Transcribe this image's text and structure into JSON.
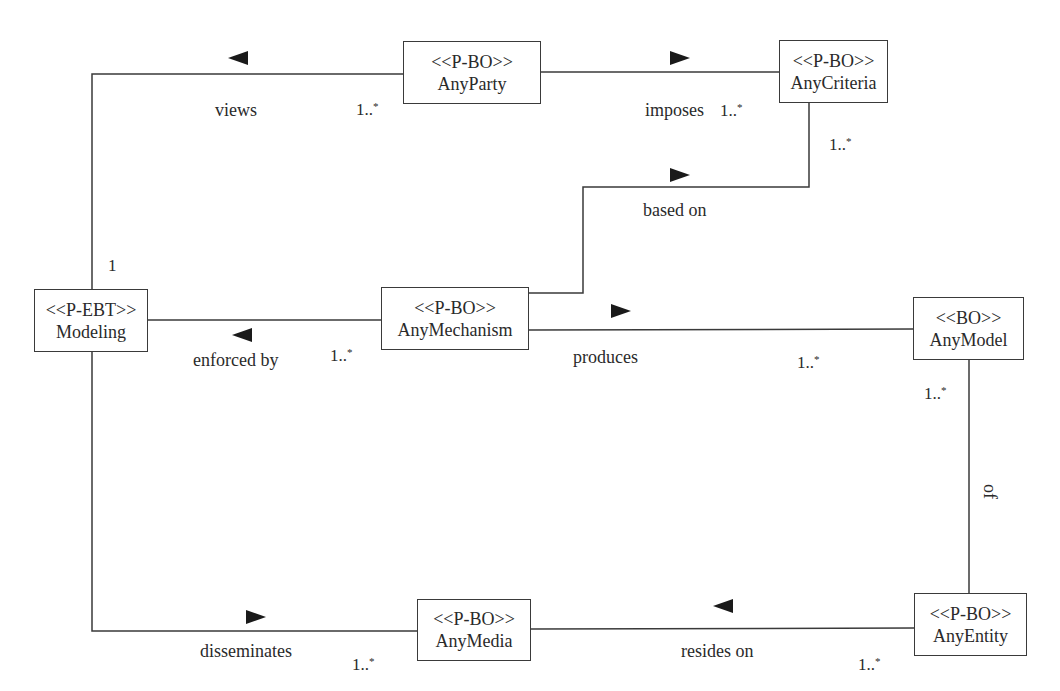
{
  "diagram": {
    "type": "uml-class-association",
    "classes": [
      {
        "id": "any_party",
        "stereotype": "<<P-BO>>",
        "name": "AnyParty",
        "x": 403,
        "y": 41,
        "w": 138,
        "h": 63
      },
      {
        "id": "any_criteria",
        "stereotype": "<<P-BO>>",
        "name": "AnyCriteria",
        "x": 779,
        "y": 40,
        "w": 109,
        "h": 63
      },
      {
        "id": "modeling",
        "stereotype": "<<P-EBT>>",
        "name": "Modeling",
        "x": 34,
        "y": 289,
        "w": 114,
        "h": 63
      },
      {
        "id": "any_mechanism",
        "stereotype": "<<P-BO>>",
        "name": "AnyMechanism",
        "x": 381,
        "y": 287,
        "w": 148,
        "h": 63
      },
      {
        "id": "any_model",
        "stereotype": "<<BO>>",
        "name": "AnyModel",
        "x": 913,
        "y": 297,
        "w": 111,
        "h": 63
      },
      {
        "id": "any_media",
        "stereotype": "<<P-BO>>",
        "name": "AnyMedia",
        "x": 417,
        "y": 599,
        "w": 114,
        "h": 62
      },
      {
        "id": "any_entity",
        "stereotype": "<<P-BO>>",
        "name": "AnyEntity",
        "x": 914,
        "y": 593,
        "w": 113,
        "h": 63
      }
    ],
    "associations": [
      {
        "id": "views",
        "label": "views",
        "from": "modeling",
        "to": "any_party",
        "direction": "left",
        "multiplicity_from": "1",
        "multiplicity_to": "1..*"
      },
      {
        "id": "imposes",
        "label": "imposes",
        "from": "any_party",
        "to": "any_criteria",
        "direction": "right",
        "multiplicity_to": "1..*"
      },
      {
        "id": "based_on",
        "label": "based on",
        "from": "any_mechanism",
        "to": "any_criteria",
        "direction": "right",
        "multiplicity_to": "1..*"
      },
      {
        "id": "enforced_by",
        "label": "enforced by",
        "from": "modeling",
        "to": "any_mechanism",
        "direction": "left",
        "multiplicity_to": "1..*"
      },
      {
        "id": "produces",
        "label": "produces",
        "from": "any_mechanism",
        "to": "any_model",
        "direction": "right",
        "multiplicity_to": "1..*"
      },
      {
        "id": "of",
        "label": "of",
        "from": "any_model",
        "to": "any_entity",
        "direction": "none",
        "multiplicity_from": "1..*"
      },
      {
        "id": "disseminates",
        "label": "disseminates",
        "from": "modeling",
        "to": "any_media",
        "direction": "right",
        "multiplicity_to": "1..*"
      },
      {
        "id": "resides_on",
        "label": "resides on",
        "from": "any_entity",
        "to": "any_media",
        "direction": "left",
        "multiplicity_from": "1..*"
      }
    ],
    "multiplicities": {
      "views_party": "1..",
      "views_modeling": "1",
      "imposes_criteria": "1..",
      "criteria_basedon": "1..",
      "enforced_mechanism": "1..",
      "produces_model": "1..",
      "of_model": "1..",
      "disseminates_media": "1..",
      "resides_entity": "1..",
      "star": "*"
    },
    "colors": {
      "line": "#3a3a3a",
      "arrow": "#1a1a1a",
      "text": "#2a2a2a",
      "background": "#ffffff"
    }
  }
}
